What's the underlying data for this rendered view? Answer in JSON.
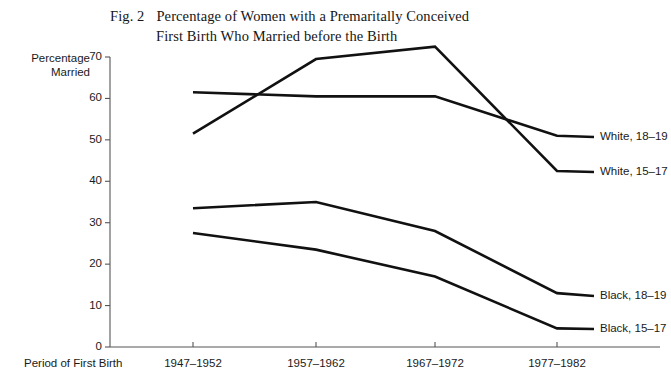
{
  "figure": {
    "number": "Fig. 2",
    "title_line1": "Percentage of Women with a Premaritally Conceived",
    "title_line2": "First Birth Who Married before the Birth"
  },
  "axes": {
    "y_title_line1": "Percentage",
    "y_title_line2": "Married",
    "x_title": "Period of First Birth"
  },
  "chart_data": {
    "type": "line",
    "xlabel": "Period of First Birth",
    "ylabel": "Percentage Married",
    "categories": [
      "1947–1952",
      "1957–1962",
      "1967–1972",
      "1977–1982"
    ],
    "ylim": [
      0,
      70
    ],
    "yticks": [
      0,
      10,
      20,
      30,
      40,
      50,
      60,
      70
    ],
    "ytick_labels": [
      "0",
      "10",
      "20",
      "30",
      "40",
      "50",
      "60",
      "70"
    ],
    "grid": false,
    "legend": "inline-right-end-labels",
    "series": [
      {
        "name": "White, 15–17",
        "values": [
          51.5,
          69.5,
          72.5,
          42.5
        ],
        "color": "#111111"
      },
      {
        "name": "White, 18–19",
        "values": [
          61.5,
          60.5,
          60.5,
          51.0
        ],
        "color": "#111111"
      },
      {
        "name": "Black, 18–19",
        "values": [
          33.5,
          35.0,
          28.0,
          13.0
        ],
        "color": "#111111"
      },
      {
        "name": "Black, 15–17",
        "values": [
          27.5,
          23.5,
          17.0,
          4.5
        ],
        "color": "#111111"
      }
    ],
    "annotations": [
      {
        "text": "White, 18–19",
        "series": "White, 18–19"
      },
      {
        "text": "White, 15–17",
        "series": "White, 15–17"
      },
      {
        "text": "Black, 18–19",
        "series": "Black, 18–19"
      },
      {
        "text": "Black, 15–17",
        "series": "Black, 15–17"
      }
    ]
  },
  "colors": {
    "ink": "#111111",
    "axis": "#555555",
    "background": "#ffffff"
  }
}
